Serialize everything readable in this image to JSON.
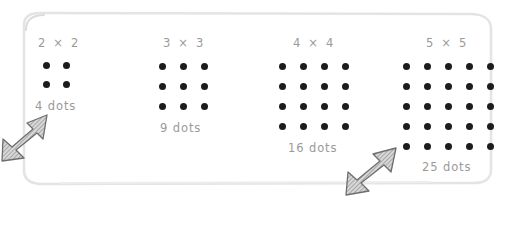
{
  "panel": {
    "name": "square-numbers-panel",
    "border_color": "#e2e2e2",
    "background": "#ffffff"
  },
  "text_color": "#9a9a9a",
  "dot_color": "#1c1c1c",
  "groups": [
    {
      "id": "group-2",
      "title": "2 × 2",
      "rows": 2,
      "cols": 2,
      "dots": 4,
      "label": "4 dots"
    },
    {
      "id": "group-3",
      "title": "3 × 3",
      "rows": 3,
      "cols": 3,
      "dots": 9,
      "label": "9 dots"
    },
    {
      "id": "group-4",
      "title": "4 × 4",
      "rows": 4,
      "cols": 4,
      "dots": 16,
      "label": "16 dots"
    },
    {
      "id": "group-5",
      "title": "5 × 5",
      "rows": 5,
      "cols": 5,
      "dots": 25,
      "label": "25 dots"
    }
  ],
  "cursors": [
    {
      "name": "cursor-arrow-left",
      "direction": "up-right"
    },
    {
      "name": "cursor-arrow-right",
      "direction": "up-right"
    }
  ]
}
